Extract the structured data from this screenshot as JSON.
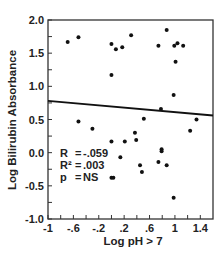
{
  "chart_data": {
    "type": "scatter",
    "title": "",
    "xlabel": "Log pH > 7",
    "ylabel": "Log Bilirubin Absorbance",
    "xlim": [
      -1,
      1.6
    ],
    "ylim": [
      -1.0,
      2.0
    ],
    "x_ticks": [
      -1,
      -0.8,
      -0.6,
      -0.4,
      -0.2,
      0,
      0.2,
      0.4,
      0.6,
      0.8,
      1,
      1.2,
      1.4
    ],
    "x_tick_labels": [
      {
        "value": -1,
        "label": "-1"
      },
      {
        "value": -0.6,
        "label": "-.6"
      },
      {
        "value": -0.2,
        "label": "-.2"
      },
      {
        "value": 0.2,
        "label": ".2"
      },
      {
        "value": 0.6,
        "label": ".6"
      },
      {
        "value": 1,
        "label": "1"
      },
      {
        "value": 1.4,
        "label": "1.4"
      }
    ],
    "y_ticks": [
      -1.0,
      -0.75,
      -0.5,
      -0.25,
      0.0,
      0.25,
      0.5,
      0.75,
      1.0,
      1.25,
      1.5,
      1.75,
      2.0
    ],
    "y_tick_labels": [
      {
        "value": 2.0,
        "label": "2.0"
      },
      {
        "value": 1.5,
        "label": "1.5"
      },
      {
        "value": 1.0,
        "label": "1.0"
      },
      {
        "value": 0.5,
        "label": "0.5"
      },
      {
        "value": 0.0,
        "label": "0.0"
      },
      {
        "value": -0.5,
        "label": "-0.5"
      },
      {
        "value": -1.0,
        "label": "-1.0"
      }
    ],
    "grid": false,
    "legend": null,
    "series": [
      {
        "name": "observations",
        "points": [
          [
            -0.69,
            1.67
          ],
          [
            -0.52,
            1.74
          ],
          [
            0.0,
            1.64
          ],
          [
            0.07,
            1.56
          ],
          [
            0.17,
            1.59
          ],
          [
            0.0,
            1.17
          ],
          [
            0.31,
            1.77
          ],
          [
            0.87,
            1.85
          ],
          [
            0.74,
            1.61
          ],
          [
            0.99,
            1.61
          ],
          [
            1.04,
            1.65
          ],
          [
            1.13,
            1.61
          ],
          [
            1.01,
            1.37
          ],
          [
            0.98,
            0.87
          ],
          [
            0.78,
            0.66
          ],
          [
            0.51,
            0.51
          ],
          [
            1.34,
            0.5
          ],
          [
            -0.52,
            0.47
          ],
          [
            -0.3,
            0.36
          ],
          [
            1.24,
            0.33
          ],
          [
            0.37,
            0.3
          ],
          [
            0.39,
            0.19
          ],
          [
            0.0,
            0.17
          ],
          [
            0.21,
            0.17
          ],
          [
            0.79,
            0.05
          ],
          [
            0.79,
            0.02
          ],
          [
            0.14,
            -0.07
          ],
          [
            0.45,
            -0.19
          ],
          [
            0.48,
            -0.29
          ],
          [
            0.74,
            -0.14
          ],
          [
            0.87,
            -0.19
          ],
          [
            0.0,
            -0.38
          ],
          [
            0.03,
            -0.38
          ],
          [
            0.98,
            -0.68
          ]
        ]
      }
    ],
    "regression_line": {
      "x": [
        -1,
        1.6
      ],
      "y": [
        0.78,
        0.56
      ]
    },
    "annotations": [
      {
        "label": "R",
        "eq": "=",
        "value": "-.059"
      },
      {
        "label": "R²",
        "eq": "=",
        "value": ".003"
      },
      {
        "label": "p",
        "eq": "=",
        "value": "NS"
      }
    ]
  }
}
